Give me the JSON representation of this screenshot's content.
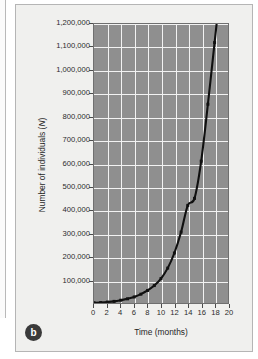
{
  "figure": {
    "panel_label": "b",
    "background_color": "#f0f0ee",
    "plot_background_color": "#8f8f8f",
    "gridline_color": "#f2f2f2",
    "curve_color": "#101010"
  },
  "chart_data": {
    "type": "line",
    "title": "",
    "subtitle": "",
    "xlabel": "Time (months)",
    "ylabel": "Number of individuals (N)",
    "ylabel_plain": "Number of individuals (",
    "ylabel_italic": "N",
    "ylabel_close": ")",
    "xlim": [
      0,
      20
    ],
    "ylim": [
      0,
      1200000
    ],
    "grid": true,
    "legend": "none",
    "x_ticks": [
      0,
      2,
      4,
      6,
      8,
      10,
      12,
      14,
      16,
      18,
      20
    ],
    "x_tick_labels": [
      "0",
      "2",
      "4",
      "6",
      "8",
      "10",
      "12",
      "14",
      "16",
      "18",
      "20"
    ],
    "y_ticks": [
      0,
      100000,
      200000,
      300000,
      400000,
      500000,
      600000,
      700000,
      800000,
      900000,
      1000000,
      1100000,
      1200000
    ],
    "y_tick_labels": [
      "",
      "100,000",
      "200,000",
      "300,000",
      "400,000",
      "500,000",
      "600,000",
      "700,000",
      "800,000",
      "900,000",
      "1,000,000",
      "1,100,000",
      "1,200,000"
    ],
    "series": [
      {
        "name": "Population size",
        "marker": "square",
        "x": [
          0,
          1,
          2,
          3,
          4,
          5,
          6,
          7,
          8,
          9,
          10,
          11,
          12,
          13,
          14,
          15,
          16,
          17,
          18,
          18.3
        ],
        "values": [
          1000,
          2000,
          4000,
          7000,
          12000,
          18000,
          26000,
          38000,
          54000,
          75000,
          105000,
          150000,
          215000,
          305000,
          420000,
          450000,
          610000,
          855000,
          1120000,
          1200000
        ]
      }
    ]
  }
}
